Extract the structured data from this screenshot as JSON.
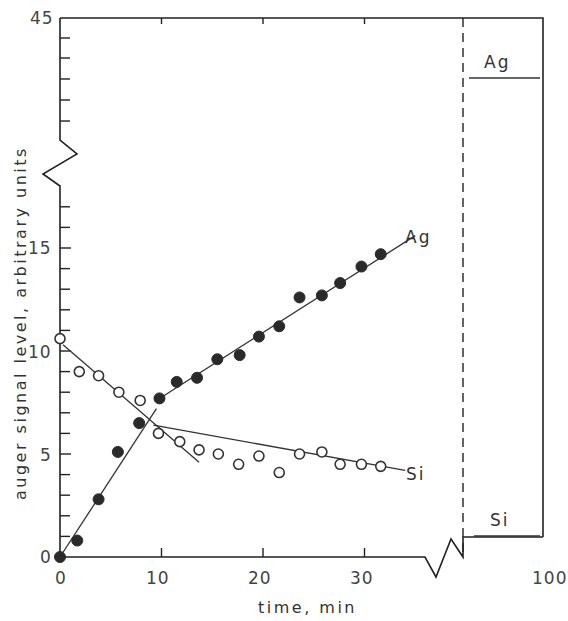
{
  "chart_data": {
    "type": "scatter",
    "title": "",
    "xlabel": "time, min",
    "ylabel": "auger signal level, arbitrary units",
    "xlim": [
      0,
      100
    ],
    "xlim_main": [
      0,
      40
    ],
    "ylim": [
      0,
      45
    ],
    "axis_break_y": [
      18,
      40
    ],
    "axis_break_x": [
      37,
      95
    ],
    "x_ticks": [
      0,
      10,
      20,
      30,
      100
    ],
    "x_tick_labels": [
      "0",
      "10",
      "20",
      "30",
      "100"
    ],
    "y_tick_labels": [
      "0",
      "5",
      "10",
      "15",
      "45"
    ],
    "y_ticks": [
      0,
      5,
      10,
      15,
      45
    ],
    "grid": false,
    "legend": "inline labels at line ends",
    "series": [
      {
        "name": "Ag",
        "marker": "filled circle",
        "x": [
          0,
          1.7,
          3.8,
          5.7,
          7.8,
          9.8,
          11.5,
          13.5,
          15.5,
          17.7,
          19.6,
          21.6,
          23.6,
          25.8,
          27.6,
          29.7,
          31.6
        ],
        "values": [
          0,
          0.8,
          2.8,
          5.1,
          6.5,
          7.7,
          8.5,
          8.7,
          9.6,
          9.8,
          10.7,
          11.2,
          12.6,
          12.7,
          13.3,
          14.1,
          14.7
        ],
        "fit_lines": [
          {
            "from": [
              0,
              0
            ],
            "to": [
              9.5,
              7.2
            ]
          },
          {
            "from": [
              9.5,
              7.6
            ],
            "to": [
              35,
              15.6
            ]
          }
        ],
        "value_at_100min": 39.5
      },
      {
        "name": "Si",
        "marker": "open circle",
        "x": [
          0,
          1.9,
          3.8,
          5.8,
          7.9,
          9.7,
          11.8,
          13.7,
          15.6,
          17.6,
          19.6,
          21.6,
          23.6,
          25.8,
          27.6,
          29.7,
          31.6
        ],
        "values": [
          10.6,
          9.0,
          8.8,
          8.0,
          7.6,
          6.0,
          5.6,
          5.2,
          5.0,
          4.5,
          4.9,
          4.1,
          5.0,
          5.1,
          4.5,
          4.5,
          4.4
        ],
        "fit_lines": [
          {
            "from": [
              0.3,
              10.3
            ],
            "to": [
              13.7,
              4.6
            ]
          },
          {
            "from": [
              9.2,
              6.4
            ],
            "to": [
              34,
              4.2
            ]
          }
        ],
        "value_at_100min": 1.0
      }
    ],
    "annotations": [
      "Ag",
      "Si",
      "Ag",
      "Si"
    ]
  },
  "labels": {
    "y_axis_title": "auger signal level, arbitrary units",
    "x_axis_title": "time, min",
    "ag_label": "Ag",
    "si_label": "Si",
    "ag_label_right": "Ag",
    "si_label_right": "Si",
    "ytick_0": "0",
    "ytick_5": "5",
    "ytick_10": "10",
    "ytick_15": "15",
    "ytick_45": "45",
    "xtick_0": "0",
    "xtick_10": "10",
    "xtick_20": "20",
    "xtick_30": "30",
    "xtick_100": "100"
  }
}
